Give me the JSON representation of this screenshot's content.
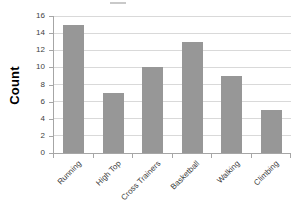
{
  "chart_data": {
    "type": "bar",
    "title": "",
    "categories": [
      "Running",
      "High Top",
      "Cross Trainers",
      "Basketball",
      "Walking",
      "Climbing"
    ],
    "values": [
      15,
      7,
      10,
      13,
      9,
      5
    ],
    "xlabel": "",
    "ylabel": "Count",
    "ylim": [
      0,
      16
    ],
    "yticks": [
      0,
      2,
      4,
      6,
      8,
      10,
      12,
      14,
      16
    ],
    "grid": true,
    "legend": false,
    "colors": {
      "bar": "#979797",
      "gridline": "#d9d9d9",
      "axis": "#a6a6a6",
      "tick_label": "#404040",
      "category_label": "#3a3a3a",
      "ylabel_text": "#000000",
      "background": "#ffffff",
      "title_fragment": "#c9c9c9"
    }
  }
}
